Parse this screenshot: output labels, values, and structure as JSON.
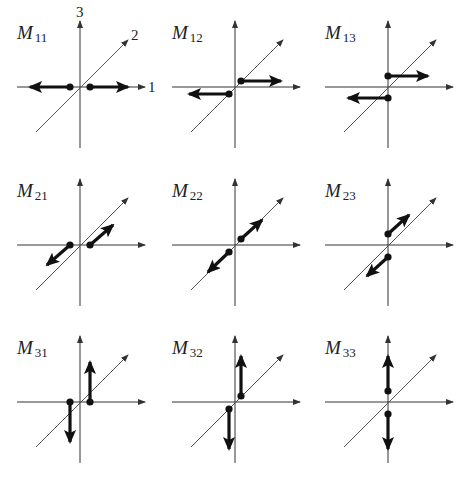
{
  "figure": {
    "axis_labels": {
      "x": "1",
      "y": "2",
      "z": "3"
    },
    "panels": [
      {
        "id": "M11",
        "letter": "M",
        "sub": "11",
        "ox": 80,
        "oy": 87,
        "vectors": [
          {
            "from": [
              -10,
              0
            ],
            "to": [
              -50,
              0
            ]
          },
          {
            "from": [
              10,
              0
            ],
            "to": [
              48,
              0
            ]
          }
        ]
      },
      {
        "id": "M12",
        "letter": "M",
        "sub": "12",
        "ox": 235,
        "oy": 87,
        "vectors": [
          {
            "from": [
              6,
              -6
            ],
            "to": [
              46,
              -6
            ]
          },
          {
            "from": [
              -6,
              7
            ],
            "to": [
              -46,
              7
            ]
          }
        ]
      },
      {
        "id": "M13",
        "letter": "M",
        "sub": "13",
        "ox": 388,
        "oy": 87,
        "vectors": [
          {
            "from": [
              0,
              -11
            ],
            "to": [
              40,
              -11
            ]
          },
          {
            "from": [
              0,
              11
            ],
            "to": [
              -40,
              11
            ]
          }
        ]
      },
      {
        "id": "M21",
        "letter": "M",
        "sub": "21",
        "ox": 80,
        "oy": 245,
        "vectors": [
          {
            "from": [
              -10,
              0
            ],
            "to": [
              -33,
              20
            ]
          },
          {
            "from": [
              10,
              0
            ],
            "to": [
              33,
              -20
            ]
          }
        ]
      },
      {
        "id": "M22",
        "letter": "M",
        "sub": "22",
        "ox": 235,
        "oy": 245,
        "vectors": [
          {
            "from": [
              6,
              -6
            ],
            "to": [
              27,
              -25
            ]
          },
          {
            "from": [
              -6,
              7
            ],
            "to": [
              -27,
              27
            ]
          }
        ]
      },
      {
        "id": "M23",
        "letter": "M",
        "sub": "23",
        "ox": 388,
        "oy": 245,
        "vectors": [
          {
            "from": [
              0,
              -11
            ],
            "to": [
              21,
              -30
            ]
          },
          {
            "from": [
              0,
              12
            ],
            "to": [
              -21,
              31
            ]
          }
        ]
      },
      {
        "id": "M31",
        "letter": "M",
        "sub": "31",
        "ox": 80,
        "oy": 402,
        "vectors": [
          {
            "from": [
              -10,
              0
            ],
            "to": [
              -10,
              40
            ]
          },
          {
            "from": [
              10,
              0
            ],
            "to": [
              10,
              -40
            ]
          }
        ]
      },
      {
        "id": "M32",
        "letter": "M",
        "sub": "32",
        "ox": 235,
        "oy": 402,
        "vectors": [
          {
            "from": [
              6,
              -6
            ],
            "to": [
              6,
              -46
            ]
          },
          {
            "from": [
              -6,
              7
            ],
            "to": [
              -6,
              47
            ]
          }
        ]
      },
      {
        "id": "M33",
        "letter": "M",
        "sub": "33",
        "ox": 388,
        "oy": 402,
        "vectors": [
          {
            "from": [
              0,
              -11
            ],
            "to": [
              0,
              -46
            ]
          },
          {
            "from": [
              0,
              12
            ],
            "to": [
              0,
              47
            ]
          }
        ]
      }
    ]
  }
}
